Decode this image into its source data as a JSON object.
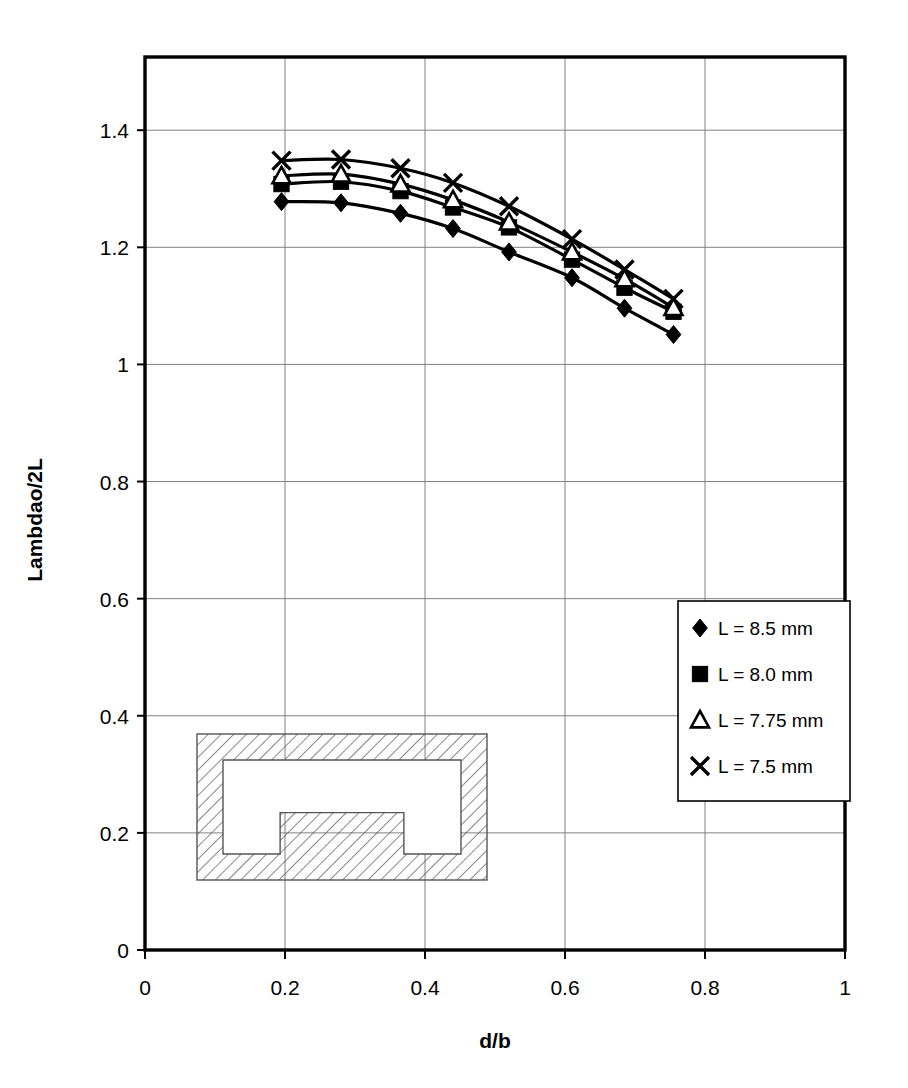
{
  "chart_data": {
    "type": "line",
    "title": "",
    "xlabel": "d/b",
    "ylabel": "Lambdao/2L",
    "xlim": [
      0,
      1
    ],
    "ylim": [
      0,
      1.525
    ],
    "xticks": [
      "0",
      "0.2",
      "0.4",
      "0.6",
      "0.8",
      "1"
    ],
    "xtick_values": [
      0,
      0.2,
      0.4,
      0.6,
      0.8,
      1
    ],
    "yticks": [
      "0",
      "0.2",
      "0.4",
      "0.6",
      "0.8",
      "1",
      "1.2",
      "1.4"
    ],
    "ytick_values": [
      0,
      0.2,
      0.4,
      0.6,
      0.8,
      1,
      1.2,
      1.4
    ],
    "grid": true,
    "legend_position": "right-middle",
    "x": [
      0.195,
      0.28,
      0.365,
      0.44,
      0.52,
      0.61,
      0.685,
      0.755
    ],
    "series": [
      {
        "name": "L = 8.5 mm",
        "marker": "diamond",
        "values": [
          1.278,
          1.276,
          1.258,
          1.232,
          1.192,
          1.148,
          1.096,
          1.051
        ]
      },
      {
        "name": "L = 8.0 mm",
        "marker": "square",
        "values": [
          1.308,
          1.312,
          1.296,
          1.268,
          1.234,
          1.179,
          1.131,
          1.09
        ]
      },
      {
        "name": "L = 7.75 mm",
        "marker": "triangle",
        "values": [
          1.322,
          1.325,
          1.308,
          1.281,
          1.243,
          1.192,
          1.146,
          1.097
        ]
      },
      {
        "name": "L = 7.5 mm",
        "marker": "cross",
        "values": [
          1.348,
          1.35,
          1.335,
          1.31,
          1.27,
          1.214,
          1.162,
          1.112
        ]
      }
    ]
  },
  "legend": {
    "items": [
      {
        "label": "L = 8.5 mm",
        "marker": "diamond"
      },
      {
        "label": "L = 8.0 mm",
        "marker": "square"
      },
      {
        "label": "L = 7.75 mm",
        "marker": "triangle"
      },
      {
        "label": "L = 7.5 mm",
        "marker": "cross"
      }
    ]
  },
  "inset": {
    "name": "ridged-waveguide-cross-section",
    "description": "double-ridged waveguide cross-section, hatched metal wall"
  },
  "colors": {
    "axis": "#000000",
    "grid": "#808080",
    "series": "#000000",
    "background": "#ffffff",
    "hatch": "#555555"
  }
}
